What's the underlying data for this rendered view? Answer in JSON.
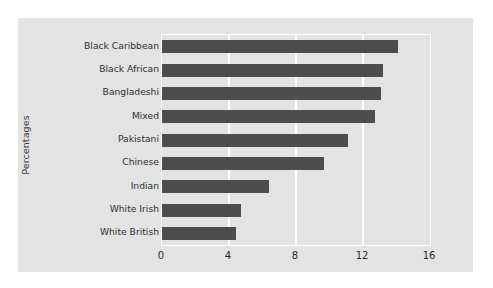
{
  "figure": {
    "background_color": "#e3e3e3",
    "page_background_color": "#ffffff",
    "bar_color": "#4d4d4d",
    "gridline_color": "#fdfdfd"
  },
  "chart_data": {
    "type": "bar",
    "orientation": "horizontal",
    "title": "",
    "subtitle": "",
    "xlabel": "",
    "ylabel": "Percentages",
    "categories": [
      "Black Caribbean",
      "Black African",
      "Bangladeshi",
      "Mixed",
      "Pakistani",
      "Chinese",
      "Indian",
      "White Irish",
      "White British"
    ],
    "values": [
      14.1,
      13.2,
      13.1,
      12.7,
      11.1,
      9.7,
      6.4,
      4.7,
      4.4
    ],
    "xlim": [
      0,
      16
    ],
    "xticks": [
      0,
      4,
      8,
      12,
      16
    ],
    "xtick_labels": [
      "0",
      "4",
      "8",
      "12",
      "16"
    ],
    "grid": true,
    "grid_axis": "x",
    "legend": false,
    "legend_position": "none"
  }
}
